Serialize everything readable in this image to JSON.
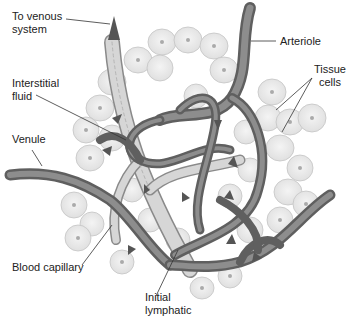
{
  "diagram": {
    "labels": {
      "to_venous_system": [
        "To venous",
        "system"
      ],
      "arteriole": "Arteriole",
      "interstitial_fluid": [
        "Interstitial",
        "fluid"
      ],
      "tissue_cells": [
        "Tissue",
        "cells"
      ],
      "venule": "Venule",
      "blood_capillary": "Blood capillary",
      "initial_lymphatic": [
        "Initial",
        "lymphatic"
      ]
    },
    "colors": {
      "background": "#ffffff",
      "cell_fill": "#ececec",
      "cell_stroke": "#bdbdbd",
      "nucleus": "#a8a8a8",
      "vessel": "#6e6e6e",
      "vessel_highlight": "#9a9a9a",
      "lymphatic": "#cfcfcf",
      "lymphatic_stroke": "#8a8a8a",
      "arrow": "#555555",
      "leader_line": "#333333",
      "text": "#222222"
    }
  }
}
